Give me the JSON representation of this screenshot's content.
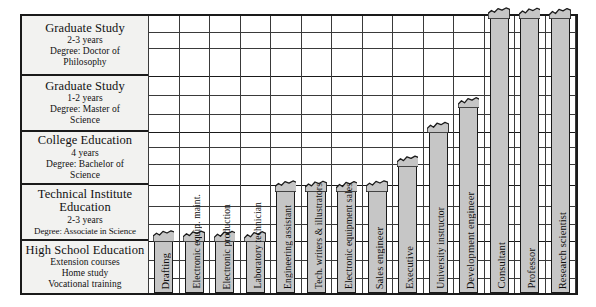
{
  "figure": {
    "type": "stepped-bar-education-ladder"
  },
  "education_levels": [
    {
      "id": "graduate-doctorate",
      "title": "Graduate Study",
      "duration": "2-3 years",
      "degree_line1": "Degree: Doctor of",
      "degree_line2": "Philosophy"
    },
    {
      "id": "graduate-masters",
      "title": "Graduate Study",
      "duration": "1-2 years",
      "degree_line1": "Degree: Master of",
      "degree_line2": "Science"
    },
    {
      "id": "college",
      "title": "College Education",
      "duration": "4 years",
      "degree_line1": "Degree: Bachelor of",
      "degree_line2": "Science"
    },
    {
      "id": "technical-institute",
      "title_line1": "Technical Institute",
      "title_line2": "Education",
      "duration": "2-3 years",
      "degree_line1": "Degree: Associate in Science"
    },
    {
      "id": "high-school",
      "title": "High School Education",
      "sub1": "Extension courses",
      "sub2": "Home study",
      "sub3": "Vocational training"
    }
  ],
  "chart_data": {
    "type": "bar",
    "xlabel": "",
    "ylabel": "Education level",
    "orientation": "vertical",
    "y_axis_levels": [
      "High School Education",
      "Technical Institute Education",
      "College Education",
      "Graduate Study (Master of Science)",
      "Graduate Study (Doctor of Philosophy)"
    ],
    "value_units": "education level reached (0 = high school, 5 = doctorate)",
    "categories": [
      "Drafting",
      "Electronic equip. maint.",
      "Electronic production",
      "Laboratory technician",
      "Engineering assistant",
      "Tech. writers & illustrators",
      "Electronic equipment sales",
      "Sales engineer",
      "Executive",
      "University instructor",
      "Development engineer",
      "Consultant",
      "Professor",
      "Research scientist"
    ],
    "values": [
      1.0,
      1.0,
      1.0,
      1.0,
      1.9,
      1.9,
      1.9,
      1.9,
      2.35,
      3.0,
      3.45,
      5.0,
      5.0,
      5.0
    ],
    "ylim": [
      0,
      5
    ],
    "grid": true,
    "legend": false,
    "bar_color": "#c6c6c6",
    "bar_border_color": "#1a1a1a"
  },
  "careers": [
    {
      "label": "Drafting",
      "level": 1.0
    },
    {
      "label": "Electronic equip. maint.",
      "level": 1.0
    },
    {
      "label": "Electronic production",
      "level": 1.0
    },
    {
      "label": "Laboratory technician",
      "level": 1.0
    },
    {
      "label": "Engineering assistant",
      "level": 1.9
    },
    {
      "label": "Tech. writers & illustrators",
      "level": 1.9
    },
    {
      "label": "Electronic equipment sales",
      "level": 1.9
    },
    {
      "label": "Sales engineer",
      "level": 1.9
    },
    {
      "label": "Executive",
      "level": 2.35
    },
    {
      "label": "University instructor",
      "level": 3.0
    },
    {
      "label": "Development engineer",
      "level": 3.45
    },
    {
      "label": "Consultant",
      "level": 5.0
    },
    {
      "label": "Professor",
      "level": 5.0
    },
    {
      "label": "Research scientist",
      "level": 5.0
    }
  ],
  "colors": {
    "bar_fill": "#c6c6c6",
    "ink": "#1a1a1a",
    "panel": "#f2f2f0",
    "page": "#ffffff"
  }
}
